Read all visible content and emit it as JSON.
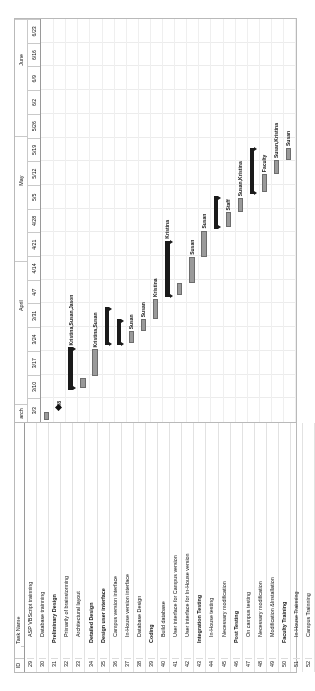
{
  "app": {
    "view": "gantt-chart",
    "orientation": "rotated-90-ccw"
  },
  "table": {
    "headers": {
      "id": "ID",
      "indicator": "",
      "task_name": "Task Name"
    },
    "rows": [
      {
        "id": "29",
        "name": "ASP VBScript trainning",
        "level": 2,
        "summary": false
      },
      {
        "id": "30",
        "name": "Database trainning",
        "level": 2,
        "summary": false
      },
      {
        "id": "31",
        "name": "Preliminary Design",
        "level": 1,
        "summary": true
      },
      {
        "id": "32",
        "name": "Primarily of brainstorming",
        "level": 2,
        "summary": false
      },
      {
        "id": "33",
        "name": "Architectural layout",
        "level": 2,
        "summary": false
      },
      {
        "id": "34",
        "name": "Detailed Design",
        "level": 1,
        "summary": true
      },
      {
        "id": "35",
        "name": "Design user interface",
        "level": 1,
        "summary": true
      },
      {
        "id": "36",
        "name": "Campus version interface",
        "level": 2,
        "summary": false
      },
      {
        "id": "37",
        "name": "In-House version interface",
        "level": 2,
        "summary": false
      },
      {
        "id": "38",
        "name": "Database Design",
        "level": 2,
        "summary": false
      },
      {
        "id": "39",
        "name": "Coding",
        "level": 1,
        "summary": true
      },
      {
        "id": "40",
        "name": "Build database",
        "level": 2,
        "summary": false
      },
      {
        "id": "41",
        "name": "User interface for Campus version",
        "level": 2,
        "summary": false
      },
      {
        "id": "42",
        "name": "User interface for In-House version",
        "level": 2,
        "summary": false
      },
      {
        "id": "43",
        "name": "Integration Testing",
        "level": 1,
        "summary": true
      },
      {
        "id": "44",
        "name": "In-House testing",
        "level": 2,
        "summary": false
      },
      {
        "id": "45",
        "name": "Necessary modification",
        "level": 2,
        "summary": false
      },
      {
        "id": "46",
        "name": "Post Testing",
        "level": 1,
        "summary": true
      },
      {
        "id": "47",
        "name": "On campus testing",
        "level": 2,
        "summary": false
      },
      {
        "id": "48",
        "name": "Necessary modification",
        "level": 2,
        "summary": false
      },
      {
        "id": "49",
        "name": "Modification &Installation",
        "level": 2,
        "summary": false
      },
      {
        "id": "50",
        "name": "Faculty Training",
        "level": 1,
        "summary": true
      },
      {
        "id": "51",
        "name": "In-House Trainning",
        "level": 2,
        "summary": false
      },
      {
        "id": "52",
        "name": "Campus Trainning",
        "level": 2,
        "summary": false
      }
    ]
  },
  "timeline": {
    "months": [
      {
        "label": "arch",
        "start_pct": 0.0,
        "end_pct": 4.5
      },
      {
        "label": "April",
        "start_pct": 18.0,
        "end_pct": 40.0
      },
      {
        "label": "May",
        "start_pct": 49.0,
        "end_pct": 71.0
      },
      {
        "label": "June",
        "start_pct": 80.0,
        "end_pct": 100.0
      }
    ],
    "weeks": [
      "3/3",
      "3/10",
      "3/17",
      "3/24",
      "3/31",
      "4/7",
      "4/14",
      "4/21",
      "4/28",
      "5/5",
      "5/12",
      "5/19",
      "5/26",
      "6/2",
      "6/9",
      "6/16",
      "6/23"
    ]
  },
  "chart_data": {
    "type": "bar",
    "xlabel": "",
    "ylabel": "",
    "bars": [
      {
        "row": 0,
        "kind": "task",
        "start_pct": 0.5,
        "end_pct": 2.6,
        "label": ""
      },
      {
        "row": 1,
        "kind": "milestone",
        "start_pct": 3.0,
        "end_pct": 3.0,
        "label": "3/8"
      },
      {
        "row": 2,
        "kind": "summary",
        "start_pct": 8.0,
        "end_pct": 18.5,
        "label": "Kristina,Susan,Jason"
      },
      {
        "row": 3,
        "kind": "task",
        "start_pct": 8.5,
        "end_pct": 11.0,
        "label": ""
      },
      {
        "row": 4,
        "kind": "task",
        "start_pct": 11.5,
        "end_pct": 18.0,
        "label": "Kristina,Susan"
      },
      {
        "row": 5,
        "kind": "summary",
        "start_pct": 19.0,
        "end_pct": 28.5,
        "label": ""
      },
      {
        "row": 6,
        "kind": "summary",
        "start_pct": 19.0,
        "end_pct": 25.5,
        "label": ""
      },
      {
        "row": 7,
        "kind": "task",
        "start_pct": 19.5,
        "end_pct": 22.5,
        "label": "Susan"
      },
      {
        "row": 8,
        "kind": "task",
        "start_pct": 22.5,
        "end_pct": 25.5,
        "label": "Susan"
      },
      {
        "row": 9,
        "kind": "task",
        "start_pct": 25.5,
        "end_pct": 30.5,
        "label": "Kristina"
      },
      {
        "row": 10,
        "kind": "summary",
        "start_pct": 31.0,
        "end_pct": 45.0,
        "label": "Kristina"
      },
      {
        "row": 11,
        "kind": "task",
        "start_pct": 31.5,
        "end_pct": 34.5,
        "label": ""
      },
      {
        "row": 12,
        "kind": "task",
        "start_pct": 34.5,
        "end_pct": 41.0,
        "label": "Susan"
      },
      {
        "row": 13,
        "kind": "task",
        "start_pct": 41.0,
        "end_pct": 47.5,
        "label": "Susan"
      },
      {
        "row": 14,
        "kind": "summary",
        "start_pct": 48.0,
        "end_pct": 56.0,
        "label": ""
      },
      {
        "row": 15,
        "kind": "task",
        "start_pct": 48.5,
        "end_pct": 52.0,
        "label": "Staff"
      },
      {
        "row": 16,
        "kind": "task",
        "start_pct": 52.0,
        "end_pct": 55.5,
        "label": "Susan,Kristina"
      },
      {
        "row": 17,
        "kind": "summary",
        "start_pct": 56.5,
        "end_pct": 68.0,
        "label": ""
      },
      {
        "row": 18,
        "kind": "task",
        "start_pct": 57.0,
        "end_pct": 61.5,
        "label": "Faculty"
      },
      {
        "row": 19,
        "kind": "task",
        "start_pct": 61.5,
        "end_pct": 65.0,
        "label": "Susan,Kristina"
      },
      {
        "row": 20,
        "kind": "task",
        "start_pct": 65.0,
        "end_pct": 68.0,
        "label": "Susan"
      },
      {
        "row": 21,
        "kind": "summary",
        "start_pct": 68.5,
        "end_pct": 76.0,
        "label": ""
      },
      {
        "row": 22,
        "kind": "task",
        "start_pct": 69.0,
        "end_pct": 72.0,
        "label": "Jason"
      },
      {
        "row": 23,
        "kind": "task",
        "start_pct": 72.5,
        "end_pct": 76.0,
        "label": "Jason"
      }
    ]
  },
  "colors": {
    "task_bar": "#9a9a9a",
    "summary_bar": "#1a1a1a",
    "grid": "#e2e2e2",
    "border": "#b9b9b9"
  }
}
